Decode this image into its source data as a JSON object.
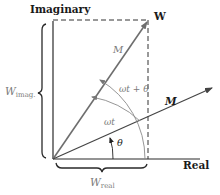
{
  "diagram": {
    "axes": {
      "vertical_label": "Imaginary",
      "horizontal_label": "Real"
    },
    "point_label": "W",
    "vectors": [
      {
        "name": "M",
        "style": "grey",
        "label": "M"
      },
      {
        "name": "M-bold",
        "style": "bold",
        "label": "M"
      }
    ],
    "angles": {
      "theta": "θ",
      "omega_t": "ωt",
      "omega_t_plus_theta": "ωt + θ"
    },
    "components": {
      "imag_base": "W",
      "imag_sub": "imag.",
      "real_base": "W",
      "real_sub": "real"
    },
    "colors": {
      "axis": "#2a2a2a",
      "vector_grey": "#6e6e6e",
      "vector_bold": "#444444",
      "dashed": "#333333",
      "arc": "#8a8a8a"
    }
  }
}
